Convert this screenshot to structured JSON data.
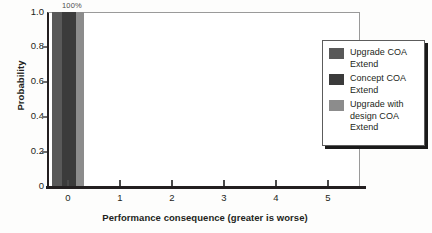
{
  "chart_data": {
    "type": "bar",
    "title": "",
    "xlabel": "Performance consequence (greater is worse)",
    "ylabel": "Probability",
    "xlim": [
      -0.5,
      5.5
    ],
    "ylim": [
      0,
      1.0
    ],
    "grid": false,
    "legend_position": "right",
    "xticklabels": [
      "0",
      "1",
      "2",
      "3",
      "4",
      "5"
    ],
    "xtickvalues": [
      0,
      1,
      2,
      3,
      4,
      5
    ],
    "yticklabels": [
      "0",
      "0.2",
      "0.4",
      "0.6",
      "0.8",
      "1.0"
    ],
    "ytickvalues": [
      0,
      0.2,
      0.4,
      0.6,
      0.8,
      1.0
    ],
    "categories": [
      "0"
    ],
    "annotations": [
      {
        "text": "100%",
        "x": 0,
        "y": 1.0
      }
    ],
    "series": [
      {
        "name": "Upgrade COA Extend",
        "values": [
          1.0
        ],
        "color": "#595959"
      },
      {
        "name": "Concept COA Extend",
        "values": [
          1.0
        ],
        "color": "#3b3b3b"
      },
      {
        "name": "Upgrade with design COA Extend",
        "values": [
          1.0
        ],
        "color": "#8c8c8c"
      }
    ]
  },
  "axes": {
    "ylabel": "Probability",
    "xlabel": "Performance consequence (greater is worse)",
    "yticks": [
      "1.0",
      "0.8",
      "0.6",
      "0.4",
      "0.2",
      "0"
    ],
    "xticks": [
      "0",
      "1",
      "2",
      "3",
      "4",
      "5"
    ]
  },
  "bar_label": "100%",
  "legend": {
    "items": [
      {
        "label": "Upgrade COA Extend",
        "color": "#595959"
      },
      {
        "label": "Concept COA Extend",
        "color": "#3b3b3b"
      },
      {
        "label": "Upgrade with design COA Extend",
        "color": "#8c8c8c"
      }
    ]
  }
}
